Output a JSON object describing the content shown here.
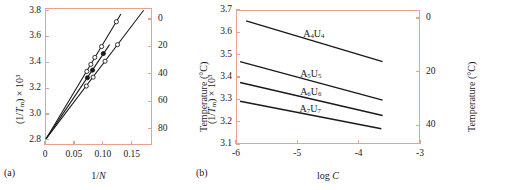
{
  "figure": {
    "panels": [
      {
        "id": "a",
        "caption": "(a)"
      },
      {
        "id": "b",
        "caption": "(b)"
      }
    ]
  },
  "panel_a": {
    "caption": "(a)",
    "xaxis": {
      "label_html": "1/<span class=\"ital\">N</span>",
      "ticks": [
        "0",
        "0.05",
        "0.10",
        "0.15"
      ],
      "values": [
        0,
        0.05,
        0.1,
        0.15
      ],
      "min": 0,
      "max": 0.185
    },
    "yaxis_left": {
      "label_html": "(1/<span class=\"ital\">T</span><sub>m</sub>) &times; 10<sup>3</sup>",
      "ticks": [
        "2.8",
        "3.0",
        "3.2",
        "3.4",
        "3.6",
        "3.8"
      ],
      "values": [
        2.8,
        3.0,
        3.2,
        3.4,
        3.6,
        3.8
      ],
      "min": 2.76,
      "max": 3.82
    },
    "yaxis_right": {
      "label_html": "Temperature (&deg;C)",
      "ticks": [
        "0",
        "20",
        "40",
        "60",
        "80"
      ],
      "values": [
        0,
        20,
        40,
        60,
        80
      ]
    }
  },
  "panel_b": {
    "caption": "(b)",
    "xaxis": {
      "label_html": "log <span class=\"ital\">C</span>",
      "ticks": [
        "-6",
        "-5",
        "-4",
        "-3"
      ],
      "values": [
        -6,
        -5,
        -4,
        -3
      ],
      "min": -6,
      "max": -3
    },
    "yaxis_left": {
      "label_html": "(1/<span class=\"ital\">T</span><sub>m</sub>) &times; 10<sup>3</sup>",
      "ticks": [
        "3.1",
        "3.2",
        "3.3",
        "3.4",
        "3.5",
        "3.6",
        "3.7"
      ],
      "values": [
        3.1,
        3.2,
        3.3,
        3.4,
        3.5,
        3.6,
        3.7
      ],
      "min": 3.1,
      "max": 3.7
    },
    "yaxis_right": {
      "label_html": "Temperature (&deg;C)",
      "ticks": [
        "0",
        "20",
        "40"
      ],
      "values": [
        0,
        20,
        40
      ]
    },
    "series_labels": [
      {
        "html": "A<sub>4</sub>U<sub>4</sub>",
        "text": "A4U4"
      },
      {
        "html": "A<sub>5</sub>U<sub>5</sub>",
        "text": "A5U5"
      },
      {
        "html": "A<sub>6</sub>U<sub>6</sub>",
        "text": "A6U6"
      },
      {
        "html": "A<sub>7</sub>U<sub>7</sub>",
        "text": "A7U7"
      }
    ]
  },
  "colors": {
    "axis": "#e8a090",
    "data": "#1a1a1a",
    "background": "#ffffff"
  },
  "chart_data": [
    {
      "type": "line",
      "panel": "a",
      "title": "",
      "xlabel": "1/N",
      "ylabel": "(1/Tm) x 10^3",
      "ylabel_right": "Temperature (C)",
      "xlim": [
        0,
        0.185
      ],
      "ylim": [
        2.76,
        3.82
      ],
      "ylim_right": [
        92,
        -8
      ],
      "xticks": [
        0,
        0.05,
        0.1,
        0.15
      ],
      "xticklabels": [
        "0",
        "0.05",
        "0.10",
        "0.15"
      ],
      "yticks": [
        2.8,
        3.0,
        3.2,
        3.4,
        3.6,
        3.8
      ],
      "yticklabels": [
        "2.8",
        "3.0",
        "3.2",
        "3.4",
        "3.6",
        "3.8"
      ],
      "yticks_right": [
        0,
        20,
        40,
        60,
        80
      ],
      "yticklabels_right": [
        "0",
        "20",
        "40",
        "60",
        "80"
      ],
      "grid": false,
      "legend": "none",
      "series": [
        {
          "name": "series-1",
          "marker": "open-circle",
          "intercept": 2.8,
          "slope": 7.4,
          "x": [
            0.0,
            0.072,
            0.079,
            0.086,
            0.098,
            0.124
          ],
          "y": [
            2.8,
            3.33,
            3.385,
            3.44,
            3.525,
            3.72
          ],
          "line_x": [
            0.0,
            0.132
          ],
          "line_y": [
            2.8,
            3.78
          ]
        },
        {
          "name": "series-2",
          "marker": "filled-circle",
          "intercept": 2.8,
          "slope": 6.6,
          "x": [
            0.0,
            0.073,
            0.082,
            0.101
          ],
          "y": [
            2.8,
            3.28,
            3.34,
            3.47
          ],
          "line_x": [
            0.0,
            0.112
          ],
          "line_y": [
            2.8,
            3.54
          ]
        },
        {
          "name": "series-3",
          "marker": "open-circle",
          "intercept": 2.8,
          "slope": 5.85,
          "x": [
            0.0,
            0.071,
            0.083,
            0.104,
            0.126
          ],
          "y": [
            2.8,
            3.215,
            3.285,
            3.41,
            3.54
          ],
          "line_x": [
            0.0,
            0.172
          ],
          "line_y": [
            2.8,
            3.81
          ]
        }
      ]
    },
    {
      "type": "line",
      "panel": "b",
      "title": "",
      "xlabel": "log C",
      "ylabel": "(1/Tm) x 10^3",
      "ylabel_right": "Temperature (C)",
      "xlim": [
        -6,
        -3
      ],
      "ylim": [
        3.1,
        3.7
      ],
      "ylim_right": [
        -3,
        47
      ],
      "xticks": [
        -6,
        -5,
        -4,
        -3
      ],
      "xticklabels": [
        "-6",
        "-5",
        "-4",
        "-3"
      ],
      "yticks": [
        3.1,
        3.2,
        3.3,
        3.4,
        3.5,
        3.6,
        3.7
      ],
      "yticklabels": [
        "3.1",
        "3.2",
        "3.3",
        "3.4",
        "3.5",
        "3.6",
        "3.7"
      ],
      "yticks_right": [
        0,
        20,
        40
      ],
      "yticklabels_right": [
        "0",
        "20",
        "40"
      ],
      "grid": false,
      "legend": "inline-labels",
      "series": [
        {
          "name": "A4U4",
          "label": "A4U4",
          "x": [
            -5.85,
            -3.6
          ],
          "y": [
            3.655,
            3.47
          ]
        },
        {
          "name": "A5U5",
          "label": "A5U5",
          "x": [
            -5.95,
            -3.6
          ],
          "y": [
            3.47,
            3.295
          ]
        },
        {
          "name": "A6U6",
          "label": "A6U6",
          "x": [
            -5.95,
            -3.6
          ],
          "y": [
            3.375,
            3.225
          ]
        },
        {
          "name": "A7U7",
          "label": "A7U7",
          "x": [
            -5.95,
            -3.62
          ],
          "y": [
            3.29,
            3.165
          ]
        }
      ]
    }
  ]
}
